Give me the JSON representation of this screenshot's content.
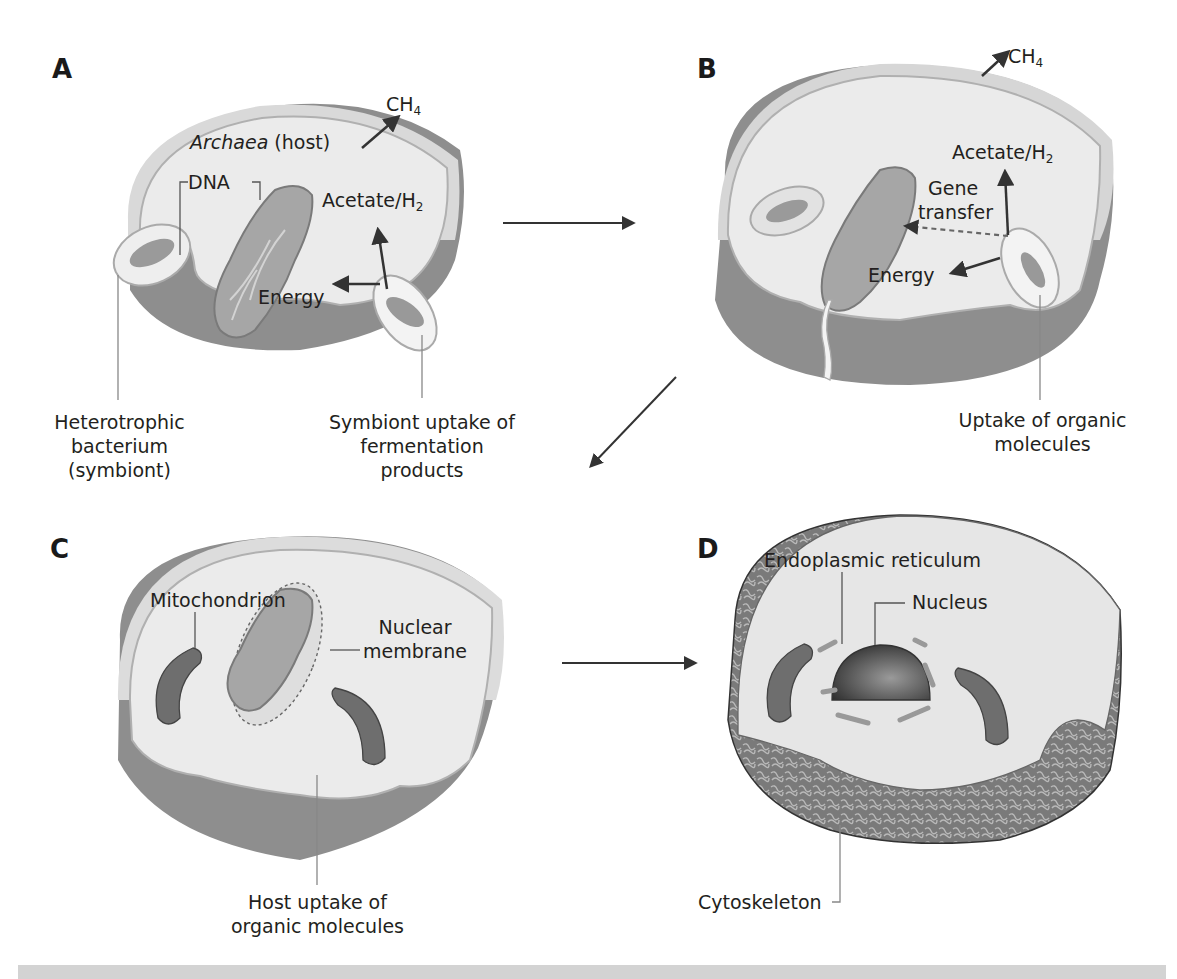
{
  "figure": {
    "panels": [
      {
        "letter": "A",
        "labels": {
          "host": "Archaea",
          "host_suffix": "(host)",
          "dna": "DNA",
          "methane": "CH",
          "methane_sub": "4",
          "acetate": "Acetate/H",
          "acetate_sub": "2",
          "energy": "Energy",
          "callout_left_line1": "Heterotrophic",
          "callout_left_line2": "bacterium",
          "callout_left_line3": "(symbiont)",
          "callout_right_line1": "Symbiont uptake of",
          "callout_right_line2": "fermentation",
          "callout_right_line3": "products"
        }
      },
      {
        "letter": "B",
        "labels": {
          "methane": "CH",
          "methane_sub": "4",
          "acetate": "Acetate/H",
          "acetate_sub": "2",
          "gene_line1": "Gene",
          "gene_line2": "transfer",
          "energy": "Energy",
          "callout_line1": "Uptake of organic",
          "callout_line2": "molecules"
        }
      },
      {
        "letter": "C",
        "labels": {
          "mitochondrion": "Mitochondrion",
          "nuclear_line1": "Nuclear",
          "nuclear_line2": "membrane",
          "callout_line1": "Host uptake of",
          "callout_line2": "organic molecules"
        }
      },
      {
        "letter": "D",
        "labels": {
          "er": "Endoplasmic reticulum",
          "nucleus": "Nucleus",
          "cytoskeleton": "Cytoskeleton"
        }
      }
    ],
    "flow": [
      "A → B",
      "B → C",
      "C → D"
    ],
    "colors": {
      "cell_fill": "#e6e6e6",
      "cell_edge": "#bdbdbd",
      "cell_side": "#9a9a9a",
      "dna": "#8f8f8f",
      "mito": "#6e6e6e",
      "nucleus": "#4d4d4d",
      "arrow": "#333333",
      "footer": "#d3d3d3"
    }
  }
}
